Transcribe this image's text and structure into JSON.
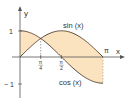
{
  "diagram": {
    "type": "function-plot",
    "functions": [
      {
        "name": "sin",
        "label": "sin (x)"
      },
      {
        "name": "cos",
        "label": "cos (x)"
      }
    ],
    "axes": {
      "x_label": "x",
      "y_label": "y",
      "x_ticks": [
        {
          "value": 0.7854,
          "label_num": "π",
          "label_den": "4"
        },
        {
          "value": 1.5708,
          "label_num": "π",
          "label_den": "2"
        }
      ],
      "x_end_label": "π",
      "y_ticks": [
        {
          "value": 1,
          "label": "1"
        },
        {
          "value": -1,
          "label": "− 1"
        }
      ],
      "x_range": [
        0,
        3.1416
      ],
      "y_range": [
        -1,
        1
      ]
    },
    "shaded_region": "area between sin(x) and cos(x) from 0 to π",
    "colors": {
      "fill": "#fbe3bf",
      "curve": "#5a4a3a",
      "axis": "#555555",
      "text": "#333333"
    }
  }
}
